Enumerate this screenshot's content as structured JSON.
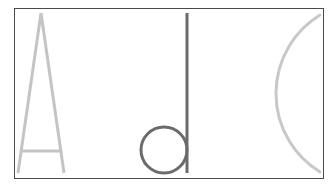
{
  "figure": {
    "glyphs": [
      {
        "name": "letter-A",
        "label": "A",
        "color": "#c4c4c4"
      },
      {
        "name": "letter-d",
        "label": "d",
        "color": "#6b6b6b"
      },
      {
        "name": "arc-C",
        "label": "(",
        "color": "#c8c8c8"
      }
    ],
    "frame_color": "#4a4a4a",
    "background": "#ffffff"
  }
}
